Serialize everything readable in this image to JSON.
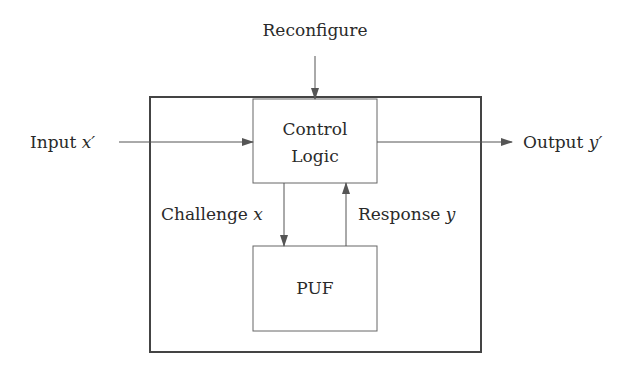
{
  "diagram": {
    "type": "block-diagram",
    "colors": {
      "stroke": "#555555",
      "outer_stroke": "#444444",
      "text": "#2a2a2a",
      "background": "#ffffff"
    },
    "external_inputs": {
      "reconfigure": {
        "label": "Reconfigure"
      },
      "input": {
        "label": "Input",
        "var": "x′"
      }
    },
    "external_outputs": {
      "output": {
        "label": "Output",
        "var": "y′"
      }
    },
    "blocks": [
      {
        "id": "control-logic",
        "line1": "Control",
        "line2": "Logic"
      },
      {
        "id": "puf",
        "label": "PUF"
      }
    ],
    "edges": [
      {
        "from": "control-logic",
        "to": "puf",
        "label": "Challenge",
        "var": "x"
      },
      {
        "from": "puf",
        "to": "control-logic",
        "label": "Response",
        "var": "y"
      }
    ]
  }
}
